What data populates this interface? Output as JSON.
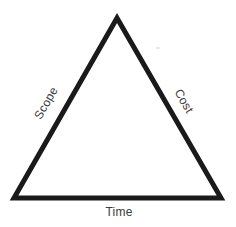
{
  "diagram": {
    "type": "project-management-triangle",
    "background_color": "#ffffff",
    "shape": {
      "name": "triangle",
      "stroke_color": "#1a1a1a",
      "stroke_width": 5,
      "fill": "none",
      "vertices": {
        "apex": [
          117,
          18
        ],
        "bottom_left": [
          14,
          198
        ],
        "bottom_right": [
          221,
          198
        ]
      }
    },
    "labels": {
      "left_edge": "Scope",
      "right_edge": "Cost",
      "bottom_edge": "Time"
    },
    "label_color": "#3b3b3b",
    "label_rotation_deg": {
      "left_edge": -60,
      "right_edge": 60,
      "bottom_edge": 0
    }
  }
}
